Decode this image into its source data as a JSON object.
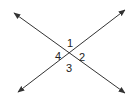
{
  "diagram": {
    "lines": [
      {
        "name": "line-a",
        "from": [
          14,
          13
        ],
        "to": [
          125,
          93
        ]
      },
      {
        "name": "line-b",
        "from": [
          18,
          92
        ],
        "to": [
          125,
          10
        ]
      }
    ],
    "intersection": [
      69,
      53
    ],
    "angles": [
      {
        "label": "1",
        "x": 70,
        "y": 47
      },
      {
        "label": "2",
        "x": 82,
        "y": 58
      },
      {
        "label": "3",
        "x": 70,
        "y": 70
      },
      {
        "label": "4",
        "x": 58,
        "y": 58
      }
    ],
    "colors": {
      "stroke": "#333333",
      "text": "#222222"
    }
  }
}
